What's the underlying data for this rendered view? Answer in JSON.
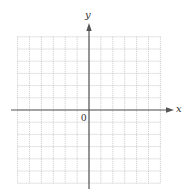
{
  "diagram": {
    "type": "coordinate-plane",
    "x_axis_label": "x",
    "y_axis_label": "y",
    "origin_label": "0",
    "grid": {
      "cells_left_of_y_axis": 6,
      "cells_right_of_y_axis": 6,
      "cells_above_x_axis": 6,
      "cells_below_x_axis": 6,
      "line_style": "dotted"
    },
    "colors": {
      "axis": "#555555",
      "grid": "#bdbdbd",
      "background": "#ffffff"
    }
  }
}
